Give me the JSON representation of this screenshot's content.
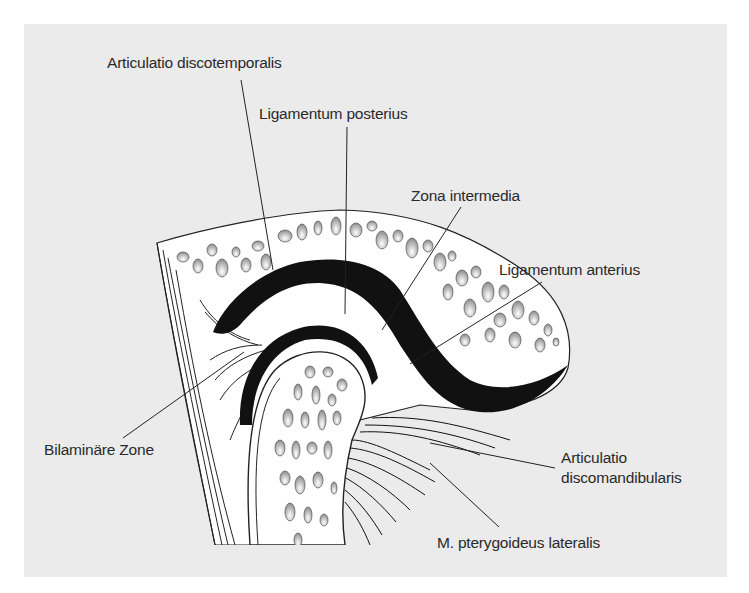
{
  "figure": {
    "colors": {
      "panel_background": "#ebebeb",
      "page_background": "#ffffff",
      "ink": "#111111",
      "bone_fill": "#ffffff",
      "label_text": "#2a2a2a"
    }
  },
  "labels": {
    "articulatio_discotemporalis": "Articulatio discotemporalis",
    "ligamentum_posterius": "Ligamentum posterius",
    "zona_intermedia": "Zona intermedia",
    "ligamentum_anterius": "Ligamentum anterius",
    "bilaminaere_zone": "Bilaminäre Zone",
    "articulatio_discomandibularis_line1": "Articulatio",
    "articulatio_discomandibularis_line2": "discomandibularis",
    "m_pterygoideus_lateralis": "M. pterygoideus lateralis"
  }
}
